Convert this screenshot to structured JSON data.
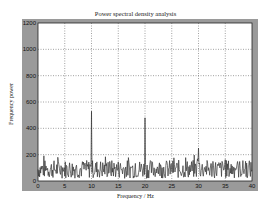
{
  "chart_data": {
    "type": "line",
    "title": "Power spectral density analysis",
    "xlabel": "Frequency / Hz",
    "ylabel": "Frequency power",
    "xlim": [
      0,
      40
    ],
    "ylim": [
      0,
      1200
    ],
    "xticks": [
      0,
      5,
      10,
      15,
      20,
      25,
      30,
      35,
      40
    ],
    "yticks": [
      0,
      200,
      400,
      600,
      800,
      1000,
      1200
    ],
    "grid": true,
    "legend": null,
    "series": [
      {
        "name": "PSD",
        "color": "#333333",
        "peaks": [
          {
            "x": 10,
            "y": 530
          },
          {
            "x": 20,
            "y": 480
          },
          {
            "x": 30,
            "y": 250
          }
        ],
        "noise_floor_range": [
          0,
          180
        ]
      }
    ]
  },
  "colors": {
    "figure_bg": "#9a9a9a",
    "plot_bg": "#ffffff",
    "grid": "#333333",
    "line": "#333333"
  }
}
